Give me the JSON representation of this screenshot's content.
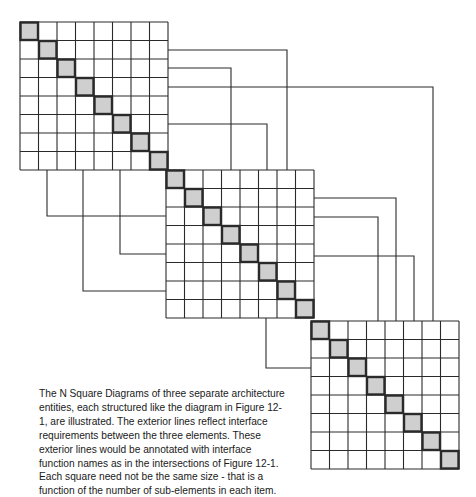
{
  "figure": {
    "caption": "The N Square Diagrams of three separate architecture entities, each structured like the diagram in Figure 12-1, are illustrated. The exterior lines reflect interface requirements between the three elements.  These exterior lines would be annotated with interface function names as in the intersections of Figure 12-1. Each square need not be the same size - that is a function of the number of sub-elements in each item.",
    "colors": {
      "line": "#2a2a2a",
      "diagonal_fill": "#cfcfcf",
      "diagonal_border": "#2a2a2a",
      "background": "#ffffff"
    }
  },
  "grids": [
    {
      "name": "entity-1",
      "x": 20,
      "y": 22,
      "n": 8,
      "cell": 18.5
    },
    {
      "name": "entity-2",
      "x": 166,
      "y": 170,
      "n": 8,
      "cell": 18.5
    },
    {
      "name": "entity-3",
      "x": 311,
      "y": 321,
      "n": 8,
      "cell": 18.5
    }
  ],
  "connectors": [
    {
      "from": "entity-1",
      "to": "entity-2",
      "points": [
        [
          168,
          50
        ],
        [
          287,
          50
        ],
        [
          287,
          170
        ]
      ]
    },
    {
      "from": "entity-1",
      "to": "entity-2",
      "points": [
        [
          168,
          68
        ],
        [
          231,
          68
        ],
        [
          231,
          170
        ]
      ]
    },
    {
      "from": "entity-1",
      "to": "entity-3",
      "points": [
        [
          168,
          87
        ],
        [
          433,
          87
        ],
        [
          433,
          321
        ]
      ]
    },
    {
      "from": "entity-1",
      "to": "entity-2",
      "points": [
        [
          168,
          124
        ],
        [
          267,
          124
        ],
        [
          267,
          170
        ]
      ]
    },
    {
      "from": "entity-1",
      "to": "entity-2",
      "points": [
        [
          47,
          170
        ],
        [
          47,
          216
        ],
        [
          166,
          216
        ]
      ]
    },
    {
      "from": "entity-1",
      "to": "entity-2",
      "points": [
        [
          83,
          170
        ],
        [
          83,
          291
        ],
        [
          166,
          291
        ]
      ]
    },
    {
      "from": "entity-1",
      "to": "entity-2",
      "points": [
        [
          120,
          170
        ],
        [
          120,
          254
        ],
        [
          166,
          254
        ]
      ]
    },
    {
      "from": "entity-2",
      "to": "entity-3",
      "points": [
        [
          314,
          198
        ],
        [
          396,
          198
        ],
        [
          396,
          321
        ]
      ]
    },
    {
      "from": "entity-2",
      "to": "entity-3",
      "points": [
        [
          314,
          217
        ],
        [
          378,
          217
        ],
        [
          378,
          321
        ]
      ]
    },
    {
      "from": "entity-2",
      "to": "entity-3",
      "points": [
        [
          314,
          256
        ],
        [
          414,
          256
        ],
        [
          414,
          321
        ]
      ]
    },
    {
      "from": "entity-2",
      "to": "entity-3",
      "points": [
        [
          266,
          318
        ],
        [
          266,
          368
        ],
        [
          311,
          368
        ]
      ]
    }
  ]
}
